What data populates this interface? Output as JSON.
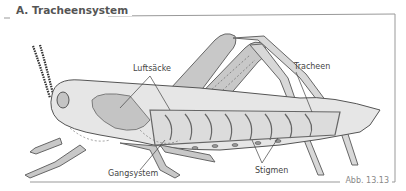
{
  "figure": {
    "title": "A. Tracheensystem",
    "caption": "Abb. 13.13"
  },
  "labels": {
    "luftsaecke": "Luftsäcke",
    "tracheen": "Tracheen",
    "gangsystem": "Gangsystem",
    "stigmen": "Stigmen"
  },
  "colors": {
    "frame": "#999999",
    "body_fill": "#e6e6e6",
    "shade_fill": "#c4c4c4",
    "outline": "#555555"
  }
}
